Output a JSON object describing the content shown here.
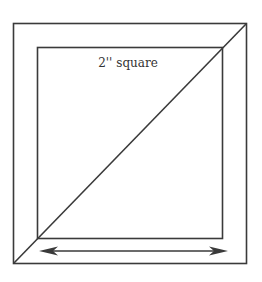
{
  "diagram": {
    "label": "2'' square",
    "colors": {
      "stroke": "#3a3a3a",
      "background": "#ffffff",
      "text": "#333333"
    },
    "elements": {
      "outer_square": "outer square",
      "inner_square": "2 inch square",
      "diagonal": "diagonal line",
      "arrow": "double-headed arrow"
    }
  }
}
